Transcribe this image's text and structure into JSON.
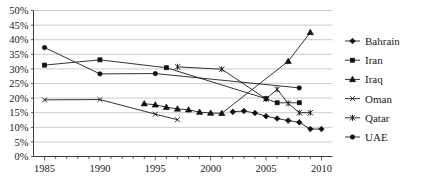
{
  "chart_data": {
    "type": "line",
    "title": "",
    "subtitle": "",
    "xlabel": "",
    "ylabel": "",
    "xlim": [
      1984,
      2011
    ],
    "ylim": [
      0,
      50
    ],
    "grid": true,
    "grid_axis": "y",
    "legend_position": "right",
    "x_ticks": [
      1985,
      1990,
      1995,
      2000,
      2005,
      2010
    ],
    "x_tick_labels": [
      "1985",
      "1990",
      "1995",
      "2000",
      "2005",
      "2010"
    ],
    "x_minor_tick_step": 1,
    "y_ticks": [
      0,
      5,
      10,
      15,
      20,
      25,
      30,
      35,
      40,
      45,
      50
    ],
    "y_tick_labels": [
      "0%",
      "5%",
      "10%",
      "15%",
      "20%",
      "25%",
      "30%",
      "35%",
      "40%",
      "45%",
      "50%"
    ],
    "value_unit": "%",
    "series": [
      {
        "name": "Bahrain",
        "marker": "diamond",
        "x": [
          2002,
          2003,
          2004,
          2005,
          2006,
          2007,
          2008,
          2009,
          2010
        ],
        "values": [
          15.3,
          15.6,
          14.9,
          13.8,
          13.0,
          12.3,
          11.7,
          9.4,
          9.4
        ]
      },
      {
        "name": "Iran",
        "marker": "square",
        "x": [
          1985,
          1990,
          1996,
          2005,
          2006,
          2008
        ],
        "values": [
          31.3,
          33.1,
          30.4,
          19.8,
          18.4,
          18.4
        ]
      },
      {
        "name": "Iraq",
        "marker": "triangle",
        "x": [
          1994,
          1995,
          1996,
          1997,
          1998,
          1999,
          2000,
          2001,
          2007,
          2009
        ],
        "values": [
          18.1,
          17.7,
          16.9,
          16.3,
          16.0,
          15.2,
          14.9,
          14.8,
          32.6,
          42.5
        ]
      },
      {
        "name": "Oman",
        "marker": "x",
        "x": [
          1985,
          1990,
          1995,
          1997
        ],
        "values": [
          19.4,
          19.5,
          14.5,
          12.6
        ]
      },
      {
        "name": "Qatar",
        "marker": "asterisk",
        "x": [
          1997,
          2001,
          2005,
          2006,
          2007,
          2008,
          2009
        ],
        "values": [
          30.7,
          29.9,
          19.7,
          23.0,
          18.2,
          15.0,
          15.0
        ]
      },
      {
        "name": "UAE",
        "marker": "circle",
        "x": [
          1985,
          1990,
          1995,
          2008
        ],
        "values": [
          37.3,
          28.3,
          28.4,
          23.5
        ]
      }
    ],
    "legend_entries": [
      {
        "label": "Bahrain",
        "marker": "diamond"
      },
      {
        "label": "Iran",
        "marker": "square"
      },
      {
        "label": "Iraq",
        "marker": "triangle"
      },
      {
        "label": "Oman",
        "marker": "x"
      },
      {
        "label": "Qatar",
        "marker": "asterisk"
      },
      {
        "label": "UAE",
        "marker": "circle"
      }
    ],
    "colors": {
      "series": "#111111",
      "grid": "#b8b8b8",
      "axis": "#3a3a3a",
      "text": "#1a1a1a",
      "background": "#ffffff"
    }
  }
}
